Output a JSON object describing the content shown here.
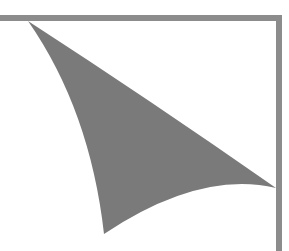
{
  "figure": {
    "colors": {
      "background": "#ffffff",
      "fill": "#7a7a7a",
      "frame": "#8c8c8c"
    },
    "frame": {
      "top_border": {
        "x1": 0,
        "y1": 18,
        "x2": 282,
        "y2": 18,
        "width": 6
      },
      "right_border": {
        "x1": 279,
        "y1": 15,
        "x2": 279,
        "y2": 251,
        "width": 6
      }
    },
    "shape": {
      "vertices": [
        [
          28,
          21
        ],
        [
          276,
          188
        ],
        [
          104,
          234
        ]
      ]
    }
  }
}
